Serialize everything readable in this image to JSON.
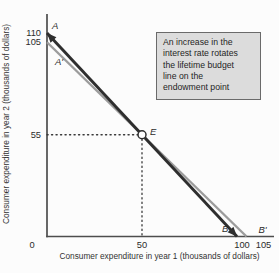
{
  "callout": {
    "lines": [
      "An increase in the",
      "interest rate rotates",
      "the lifetime budget",
      "line on the",
      "endowment point"
    ]
  },
  "axes": {
    "x_label": "Consumer expenditure in year 1 (thousands of dollars)",
    "y_label": "Consumer expenditure in year 2 (thousands of dollars)",
    "origin_label": "0",
    "x_ticks": [
      {
        "value": 50,
        "label": "50"
      },
      {
        "value": 100,
        "label": "100"
      },
      {
        "value": 105,
        "label": "105"
      }
    ],
    "y_ticks": [
      {
        "value": 110,
        "label": "110"
      },
      {
        "value": 105,
        "label": "105"
      },
      {
        "value": 55,
        "label": "55"
      }
    ]
  },
  "point_labels": [
    {
      "label": "A",
      "x": 0,
      "y": 110
    },
    {
      "label": "A'",
      "x": 0,
      "y": 105
    },
    {
      "label": "E",
      "x": 50,
      "y": 55
    },
    {
      "label": "B",
      "x": 100,
      "y": 0
    },
    {
      "label": "B'",
      "x": 105,
      "y": 0
    }
  ],
  "colors": {
    "new_line": "#2e2e2e",
    "old_line": "#9c9c9c",
    "axis": "#4d4d4d",
    "dotted": "#3a3a3a",
    "marker_fill": "#ffffff",
    "callout_bg": "#dcdcdc",
    "callout_border": "#6a6a6a",
    "text": "#2b2b2b"
  },
  "chart_data": {
    "type": "line",
    "title": "",
    "xlabel": "Consumer expenditure in year 1 (thousands of dollars)",
    "ylabel": "Consumer expenditure in year 2 (thousands of dollars)",
    "xlim": [
      0,
      118
    ],
    "ylim": [
      0,
      120
    ],
    "grid": false,
    "series": [
      {
        "name": "New budget line AB (after interest-rate increase)",
        "points": [
          {
            "x": 0,
            "y": 110
          },
          {
            "x": 100,
            "y": 0
          }
        ],
        "color": "#2e2e2e",
        "endpoint_labels": [
          "A",
          "B"
        ],
        "arrows": true
      },
      {
        "name": "Original budget line A'B'",
        "points": [
          {
            "x": 0,
            "y": 105
          },
          {
            "x": 105,
            "y": 0
          }
        ],
        "color": "#9c9c9c",
        "endpoint_labels": [
          "A'",
          "B'"
        ],
        "arrows": false
      }
    ],
    "endowment_point": {
      "x": 50,
      "y": 55,
      "label": "E",
      "marker": "open-circle"
    },
    "dotted_guides": [
      {
        "from": {
          "x": 0,
          "y": 55
        },
        "to": {
          "x": 50,
          "y": 55
        }
      },
      {
        "from": {
          "x": 50,
          "y": 55
        },
        "to": {
          "x": 50,
          "y": 0
        }
      }
    ],
    "annotation": "An increase in the interest rate rotates the lifetime budget line on the endowment point"
  }
}
